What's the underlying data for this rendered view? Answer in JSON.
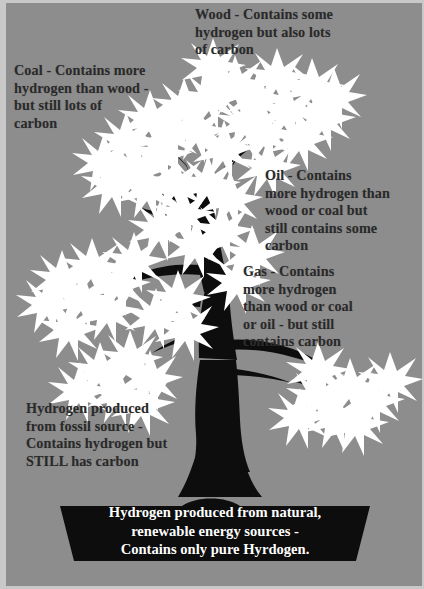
{
  "poster": {
    "title": "Hydrogen sources tree diagram",
    "background_color": "#8d8d8d",
    "foliage_color": "#ffffff",
    "tree_color": "#0d0d0d",
    "text_color": "#2a2a2a",
    "banner_text_color": "#ffffff"
  },
  "callouts": {
    "wood": "Wood - Contains some\nhydrogen but also lots\nof carbon",
    "coal": "Coal - Contains more\nhydrogen than wood -\nbut still lots of\ncarbon",
    "oil": "Oil - Contains\nmore hydrogen than\nwood or coal  but\nstill contains some\ncarbon",
    "gas": "Gas  - Contains\nmore hydrogen\nthan wood or coal\nor oil - but still\ncontains carbon",
    "fossil": "Hydrogen produced\nfrom fossil source -\nContains hydrogen but\nSTILL has carbon"
  },
  "banner": {
    "text": "Hydrogen produced from natural,\nrenewable energy sources -\nContains only pure Hyrdogen."
  }
}
